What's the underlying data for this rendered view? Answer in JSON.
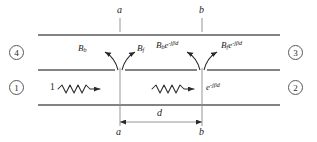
{
  "figure": {
    "type": "transmission-line-coupling-diagram",
    "background_color": "#ffffff",
    "line_color": "#5a5a5a",
    "text_color": "#1b1b1b"
  },
  "reference_planes": {
    "left": {
      "name": "a",
      "top_label": "a",
      "bottom_label": "a",
      "x": 120
    },
    "right": {
      "name": "b",
      "top_label": "b",
      "bottom_label": "b",
      "x": 202
    }
  },
  "ports": [
    {
      "id": "port-1",
      "label": "1",
      "position": "lower-left",
      "x": 14,
      "y": 80
    },
    {
      "id": "port-2",
      "label": "2",
      "position": "lower-right",
      "x": 288,
      "y": 80
    },
    {
      "id": "port-3",
      "label": "3",
      "position": "upper-right",
      "x": 288,
      "y": 45
    },
    {
      "id": "port-4",
      "label": "4",
      "position": "upper-left",
      "x": 14,
      "y": 45
    }
  ],
  "amplitudes": {
    "backward_at_a": {
      "base": "B",
      "sub": "b",
      "exp": ""
    },
    "forward_at_a": {
      "base": "B",
      "sub": "f",
      "exp": ""
    },
    "backward_at_b": {
      "base": "B",
      "sub": "b",
      "exp": "e",
      "exp_sup": "-jβd"
    },
    "forward_at_b": {
      "base": "B",
      "sub": "f",
      "exp": "e",
      "exp_sup": "-jβd"
    }
  },
  "labels": {
    "incident_wave": "1",
    "transmitted_wave_base": "e",
    "transmitted_wave_sup": "-jβd",
    "separation": "d"
  },
  "guides": {
    "horizontal_lines_y": [
      35,
      70,
      105
    ],
    "gap_half_width": 5
  },
  "dimension": {
    "label": "d",
    "from": "a",
    "to": "b",
    "y": 122
  }
}
